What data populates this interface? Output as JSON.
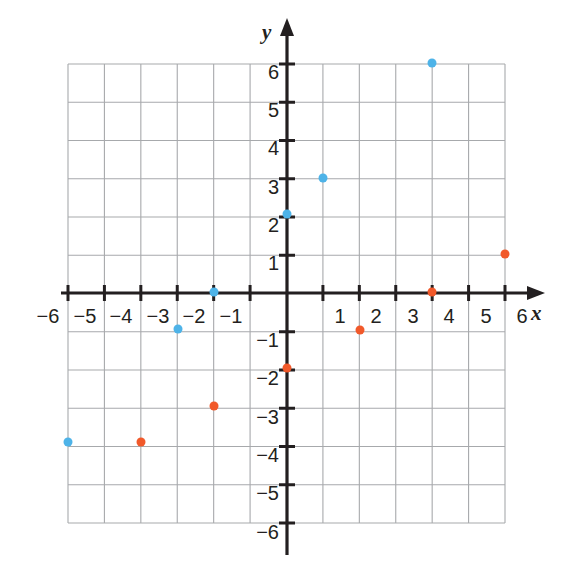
{
  "figure": {
    "title": "",
    "axis_labels": {
      "x": "x",
      "y": "y"
    },
    "colors": {
      "series_blue": "#4eb3e8",
      "series_orange": "#f1592a",
      "grid": "#a7a9ac",
      "axis": "#231f20",
      "background": "#ffffff"
    }
  },
  "chart_data": {
    "type": "scatter",
    "title": "",
    "xlabel": "x",
    "ylabel": "y",
    "xlim": [
      -6,
      6
    ],
    "ylim": [
      -6,
      6
    ],
    "grid": true,
    "legend": "none",
    "xticks": [
      "-6",
      "-5",
      "-4",
      "-3",
      "-2",
      "-1",
      "1",
      "2",
      "3",
      "4",
      "5",
      "6"
    ],
    "yticks": [
      "6",
      "5",
      "4",
      "3",
      "2",
      "1",
      "-1",
      "-2",
      "-3",
      "-4",
      "-5",
      "-6"
    ],
    "series": [
      {
        "name": "blue-points",
        "color": "#4eb3e8",
        "points": [
          {
            "x": 3.5,
            "y": 6.5
          },
          {
            "x": 1.0,
            "y": 3.5
          },
          {
            "x": 0.0,
            "y": 2.0
          },
          {
            "x": -2.0,
            "y": 0.0
          },
          {
            "x": -3.0,
            "y": -0.5
          },
          {
            "x": -5.5,
            "y": -3.5
          }
        ]
      },
      {
        "name": "orange-points",
        "color": "#f1592a",
        "points": [
          {
            "x": 5.5,
            "y": 1.5
          },
          {
            "x": 3.5,
            "y": 0.0
          },
          {
            "x": 1.5,
            "y": -0.5
          },
          {
            "x": 0.0,
            "y": -1.5
          },
          {
            "x": -2.0,
            "y": -2.5
          },
          {
            "x": -4.0,
            "y": -3.5
          }
        ]
      }
    ]
  },
  "pixel_layout": {
    "note": "pixel positions used to reproduce the rendering",
    "origin": {
      "x": 287,
      "y": 293
    },
    "unit_x": 36.4,
    "unit_y": 38.25,
    "grid_left": 68,
    "grid_right": 505,
    "grid_top": 64,
    "grid_bottom": 523
  },
  "xtick_labels": [
    {
      "text": "−6",
      "px": 48
    },
    {
      "text": "−5",
      "px": 85
    },
    {
      "text": "−4",
      "px": 121
    },
    {
      "text": "−3",
      "px": 158
    },
    {
      "text": "−2",
      "px": 194
    },
    {
      "text": "−1",
      "px": 231
    },
    {
      "text": "1",
      "px": 340
    },
    {
      "text": "2",
      "px": 376
    },
    {
      "text": "3",
      "px": 413
    },
    {
      "text": "4",
      "px": 449
    },
    {
      "text": "5",
      "px": 486
    },
    {
      "text": "6",
      "px": 522
    }
  ],
  "ytick_labels": [
    {
      "text": "6",
      "py": 72
    },
    {
      "text": "5",
      "py": 110
    },
    {
      "text": "4",
      "py": 148
    },
    {
      "text": "3",
      "py": 187
    },
    {
      "text": "2",
      "py": 225
    },
    {
      "text": "1",
      "py": 263
    },
    {
      "text": "−1",
      "py": 340
    },
    {
      "text": "−2",
      "py": 378
    },
    {
      "text": "−3",
      "py": 417
    },
    {
      "text": "−4",
      "py": 455
    },
    {
      "text": "−5",
      "py": 493
    },
    {
      "text": "−6",
      "py": 532
    }
  ],
  "plot_points": [
    {
      "series": "blue",
      "px": 432,
      "py": 63,
      "label": "blue-point-1"
    },
    {
      "series": "blue",
      "px": 323,
      "py": 178,
      "label": "blue-point-2"
    },
    {
      "series": "blue",
      "px": 287,
      "py": 214,
      "label": "blue-point-3"
    },
    {
      "series": "blue",
      "px": 214,
      "py": 292,
      "label": "blue-point-4"
    },
    {
      "series": "blue",
      "px": 178,
      "py": 329,
      "label": "blue-point-5"
    },
    {
      "series": "blue",
      "px": 68,
      "py": 442,
      "label": "blue-point-6"
    },
    {
      "series": "orange",
      "px": 505,
      "py": 254,
      "label": "orange-point-1"
    },
    {
      "series": "orange",
      "px": 432,
      "py": 292,
      "label": "orange-point-2"
    },
    {
      "series": "orange",
      "px": 360,
      "py": 330,
      "label": "orange-point-3"
    },
    {
      "series": "orange",
      "px": 287,
      "py": 368,
      "label": "orange-point-4"
    },
    {
      "series": "orange",
      "px": 214,
      "py": 406,
      "label": "orange-point-5"
    },
    {
      "series": "orange",
      "px": 141,
      "py": 442,
      "label": "orange-point-6"
    }
  ]
}
